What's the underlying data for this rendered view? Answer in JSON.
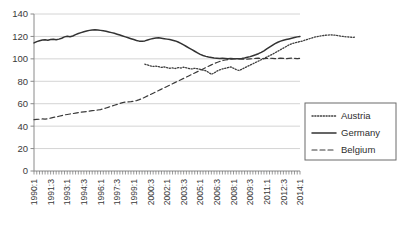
{
  "chart_data": {
    "type": "line",
    "title": "",
    "subtitle": "",
    "xlabel": "",
    "ylabel": "",
    "ylim": [
      0,
      140
    ],
    "ytick_values": [
      0,
      20,
      40,
      60,
      80,
      100,
      120,
      140
    ],
    "ytick_labels": [
      "0",
      "20",
      "40",
      "60",
      "80",
      "100",
      "120",
      "140"
    ],
    "grid": true,
    "grid_axis": "y",
    "legend_position": "right-outside",
    "x_index_start": 0,
    "x_index_end": 96,
    "x_tick_indices": [
      0,
      6,
      12,
      18,
      24,
      30,
      36,
      42,
      48,
      54,
      60,
      66,
      72,
      78,
      84,
      90,
      96
    ],
    "x_tick_labels": [
      "1990:1",
      "1991:3",
      "1993:1",
      "1994:3",
      "1996:1",
      "1997:3",
      "1999:1",
      "2000:3",
      "2002:1",
      "2003:3",
      "2005:1",
      "2006:3",
      "2008:1",
      "2009:3",
      "2011:1",
      "2012:3",
      "2014:1"
    ],
    "x_minor_ticks": true,
    "colors": {
      "austria": "#3f3f3f",
      "germany": "#333333",
      "belgium": "#3a3a3a",
      "grid": "#d4d4d4",
      "axis": "#8a8a8a",
      "text": "#333333"
    },
    "series": [
      {
        "name": "Austria",
        "style": "dotted",
        "start_index": 40,
        "values": [
          95.2,
          94.6,
          93.8,
          93.2,
          93.6,
          93.0,
          92.4,
          92.8,
          92.2,
          91.6,
          92.0,
          91.4,
          92.2,
          91.8,
          92.6,
          92.0,
          91.4,
          91.0,
          91.6,
          91.2,
          90.6,
          90.0,
          89.4,
          88.0,
          86.2,
          87.4,
          89.0,
          90.2,
          91.0,
          91.6,
          92.2,
          92.8,
          91.6,
          90.4,
          89.6,
          90.8,
          92.0,
          93.2,
          94.4,
          95.6,
          96.8,
          98.0,
          99.2,
          100.4,
          101.6,
          102.8,
          104.0,
          105.4,
          106.8,
          108.2,
          109.6,
          111.0,
          112.4,
          113.4,
          114.2,
          114.8,
          115.4,
          116.0,
          116.8,
          117.6,
          118.4,
          119.2,
          119.8,
          120.2,
          120.6,
          121.0,
          121.2,
          121.4,
          121.2,
          121.0,
          120.6,
          120.2,
          119.8,
          119.6,
          119.4,
          119.2,
          119.4
        ]
      },
      {
        "name": "Germany",
        "style": "solid",
        "start_index": 0,
        "values": [
          114.2,
          115.4,
          116.2,
          116.8,
          117.0,
          116.6,
          117.2,
          117.4,
          117.0,
          117.6,
          118.4,
          119.6,
          120.2,
          119.8,
          120.4,
          121.6,
          122.6,
          123.4,
          124.2,
          124.8,
          125.4,
          125.8,
          126.0,
          125.8,
          125.4,
          125.0,
          124.6,
          124.0,
          123.4,
          122.8,
          122.0,
          121.2,
          120.4,
          119.6,
          118.8,
          118.0,
          117.2,
          116.4,
          115.8,
          115.6,
          116.0,
          116.8,
          117.6,
          118.2,
          118.6,
          118.8,
          118.4,
          118.0,
          117.6,
          117.2,
          116.6,
          116.0,
          115.0,
          113.8,
          112.4,
          111.0,
          109.6,
          108.2,
          106.8,
          105.4,
          104.0,
          103.0,
          102.2,
          101.6,
          101.2,
          100.8,
          100.6,
          100.4,
          100.6,
          100.4,
          100.2,
          100.4,
          100.2,
          100.0,
          100.2,
          100.4,
          100.8,
          101.4,
          102.0,
          102.8,
          103.6,
          104.6,
          105.8,
          107.2,
          108.8,
          110.4,
          112.0,
          113.6,
          114.8,
          115.8,
          116.6,
          117.2,
          117.8,
          118.4,
          119.0,
          119.6,
          120.0
        ]
      },
      {
        "name": "Belgium",
        "style": "dashed",
        "start_index": 0,
        "values": [
          45.8,
          46.0,
          46.2,
          46.4,
          46.2,
          46.6,
          47.2,
          47.8,
          48.2,
          48.8,
          49.4,
          50.0,
          50.4,
          50.8,
          51.2,
          51.6,
          52.0,
          52.4,
          52.8,
          53.0,
          53.4,
          53.8,
          54.0,
          54.4,
          54.8,
          55.4,
          56.2,
          57.0,
          57.8,
          58.6,
          59.4,
          60.2,
          61.0,
          61.4,
          61.6,
          61.8,
          62.2,
          62.8,
          63.6,
          64.6,
          65.8,
          67.0,
          68.2,
          69.4,
          70.6,
          71.8,
          73.0,
          74.2,
          75.4,
          76.6,
          77.8,
          79.0,
          80.2,
          81.4,
          82.6,
          83.8,
          85.0,
          86.2,
          87.4,
          88.6,
          89.8,
          91.0,
          92.2,
          93.4,
          94.6,
          95.8,
          96.8,
          97.6,
          98.4,
          99.0,
          99.4,
          99.8,
          100.0,
          100.2,
          100.0,
          99.8,
          99.6,
          99.8,
          100.0,
          100.2,
          100.4,
          100.6,
          100.4,
          100.2,
          100.4,
          100.6,
          100.4,
          100.2,
          100.4,
          100.6,
          100.4,
          100.2,
          100.4,
          100.6,
          100.4,
          100.2,
          100.4
        ]
      }
    ],
    "legend": [
      {
        "label": "Austria",
        "style": "dotted"
      },
      {
        "label": "Germany",
        "style": "solid"
      },
      {
        "label": "Belgium",
        "style": "dashed"
      }
    ]
  }
}
